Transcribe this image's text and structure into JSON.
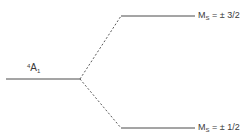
{
  "diagram": {
    "type": "energy-level-splitting",
    "colors": {
      "line": "#4a4a4a",
      "text": "#3a3a3a",
      "background": "#ffffff"
    },
    "ground_term": {
      "multiplicity": "4",
      "symbol": "A",
      "subscript": "1"
    },
    "levels": [
      {
        "label_main": "M",
        "label_sub": "S",
        "label_value": " = ± 3/2",
        "position": "upper"
      },
      {
        "label_main": "M",
        "label_sub": "S",
        "label_value": " = ± 1/2",
        "position": "lower"
      }
    ],
    "connectors": "dashed"
  }
}
